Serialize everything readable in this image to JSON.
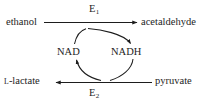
{
  "diagram": {
    "kind": "biochemical-redox-cycle",
    "title": "",
    "stroke_color": "#1d1d1d",
    "text_color": "#1d1d1d",
    "background_color": "#ffffff",
    "top_reaction": {
      "substrate": "ethanol",
      "product": "acetaldehyde",
      "enzyme_label": "E",
      "enzyme_subscript": "1",
      "direction": "left-to-right"
    },
    "bottom_reaction": {
      "substrate": "pyruvate",
      "product": "lactate",
      "product_prefix": "L",
      "product_stem": "-lactate",
      "enzyme_label": "E",
      "enzyme_subscript": "2",
      "direction": "right-to-left"
    },
    "cofactors": {
      "oxidized": "NAD",
      "reduced": "NADH",
      "cycle_direction": "clockwise"
    },
    "arrows": [
      {
        "name": "ethanol-to-acetaldehyde",
        "type": "straight",
        "points_to": "acetaldehyde"
      },
      {
        "name": "pyruvate-to-lactate",
        "type": "straight",
        "points_to": "L-lactate"
      },
      {
        "name": "nad-to-nadh",
        "type": "curved",
        "points_to": "NADH"
      },
      {
        "name": "nadh-to-nad",
        "type": "curved",
        "points_to": "NAD"
      }
    ]
  }
}
